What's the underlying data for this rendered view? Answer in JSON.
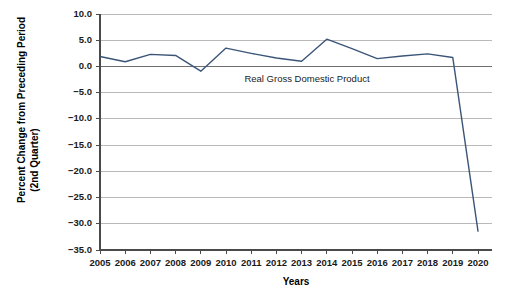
{
  "chart_data": {
    "type": "line",
    "title": "",
    "xlabel": "Years",
    "ylabel": "Percent Change from Preceding Period (2nd Quarter)",
    "ylabel_line1": "Percent Change from Preceding Period",
    "ylabel_line2": "(2nd Quarter)",
    "annotation": "Real Gross Domestic Product",
    "series_name": "Real Gross Domestic Product",
    "series_color": "#3b5578",
    "grid": true,
    "legend": "none",
    "categories": [
      "2005",
      "2006",
      "2007",
      "2008",
      "2009",
      "2010",
      "2011",
      "2012",
      "2013",
      "2014",
      "2015",
      "2016",
      "2017",
      "2018",
      "2019",
      "2020"
    ],
    "x": [
      2005,
      2006,
      2007,
      2008,
      2009,
      2010,
      2011,
      2012,
      2013,
      2014,
      2015,
      2016,
      2017,
      2018,
      2019,
      2020
    ],
    "values": [
      1.9,
      0.9,
      2.3,
      2.1,
      -0.9,
      3.5,
      2.5,
      1.6,
      1.0,
      5.2,
      3.4,
      1.5,
      2.0,
      2.4,
      1.7,
      -31.4
    ],
    "ylim": [
      -35.0,
      10.0
    ],
    "yticks": [
      10.0,
      5.0,
      0.0,
      -5.0,
      -10.0,
      -15.0,
      -20.0,
      -25.0,
      -30.0,
      -35.0
    ],
    "ytick_labels": [
      "10.0",
      "5.0",
      "0.0",
      "−5.0",
      "−10.0",
      "−15.0",
      "−20.0",
      "−25.0",
      "−30.0",
      "−35.0"
    ],
    "xtick_labels": [
      "2005",
      "2006",
      "2007",
      "2008",
      "2009",
      "2010",
      "2011",
      "2012",
      "2013",
      "2014",
      "2015",
      "2016",
      "2017",
      "2018",
      "2019",
      "2020"
    ]
  }
}
